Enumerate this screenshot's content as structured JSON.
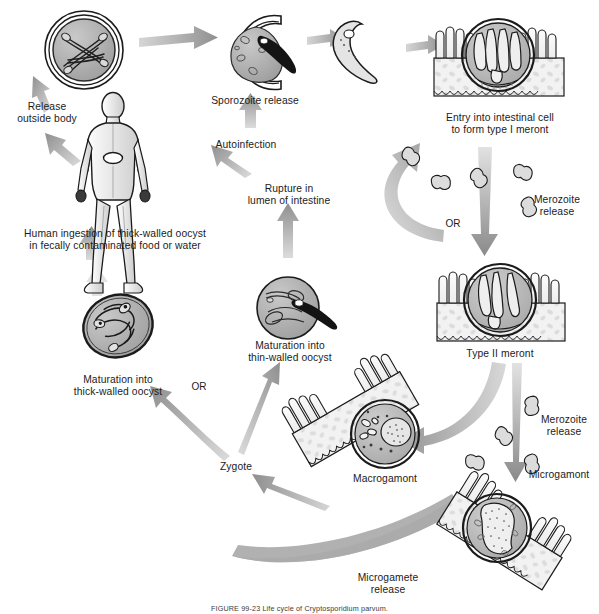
{
  "figure": {
    "caption": "FIGURE 99-23   Life cycle of Cryptosporidium parvum.",
    "background_color": "#ffffff",
    "line_color": "#1b1b1b",
    "arrow_color": "#8c8c8c",
    "cell_fill": "#b9b9b9",
    "tissue_fill": "#efefef",
    "text_color": "#1b1b1b"
  },
  "labels": {
    "release_outside_body": "Release\noutside body",
    "human_ingestion": "Human ingestion of thick-walled oocyst\nin fecally contaminated food or water",
    "sporozoite_release": "Sporozoite release",
    "autoinfection": "Autoinfection",
    "rupture_lumen": "Rupture in\nlumen of intestine",
    "entry_intestinal_cell": "Entry into intestinal cell\nto form type I meront",
    "merozoite_release_top": "Merozoite\nrelease",
    "or_top": "OR",
    "type_ii_meront": "Type II meront",
    "merozoite_release_bottom": "Merozoite\nrelease",
    "microgamont": "Microgamont",
    "macrogamont": "Macrogamont",
    "microgamete_release": "Microgamete\nrelease",
    "zygote": "Zygote",
    "or_bottom": "OR",
    "maturation_thick": "Maturation into\nthick-walled oocyst",
    "maturation_thin": "Maturation into\nthin-walled oocyst"
  },
  "stages": [
    {
      "id": "thick-walled-oocyst-released",
      "label": "Release\noutside body",
      "x": 84,
      "y": 50
    },
    {
      "id": "human-host",
      "label": "Human ingestion of thick-walled oocyst\nin fecally contaminated food or water",
      "x": 113,
      "y": 160
    },
    {
      "id": "excysting-oocyst",
      "label": "Sporozoite release",
      "x": 252,
      "y": 52
    },
    {
      "id": "free-sporozoite",
      "label": "",
      "x": 357,
      "y": 45
    },
    {
      "id": "type-i-meront",
      "label": "Entry into intestinal cell\nto form type I meront",
      "x": 498,
      "y": 62
    },
    {
      "id": "type-ii-meront",
      "label": "Type II meront",
      "x": 497,
      "y": 307
    },
    {
      "id": "macrogamont",
      "label": "Macrogamont",
      "x": 385,
      "y": 440
    },
    {
      "id": "microgamont",
      "label": "Microgamont",
      "x": 497,
      "y": 528
    },
    {
      "id": "thin-walled-oocyst",
      "label": "Maturation into\nthin-walled oocyst",
      "x": 288,
      "y": 310
    },
    {
      "id": "thick-walled-oocyst",
      "label": "Maturation into\nthick-walled oocyst",
      "x": 118,
      "y": 330
    },
    {
      "id": "zygote",
      "label": "Zygote",
      "x": 236,
      "y": 466
    }
  ]
}
